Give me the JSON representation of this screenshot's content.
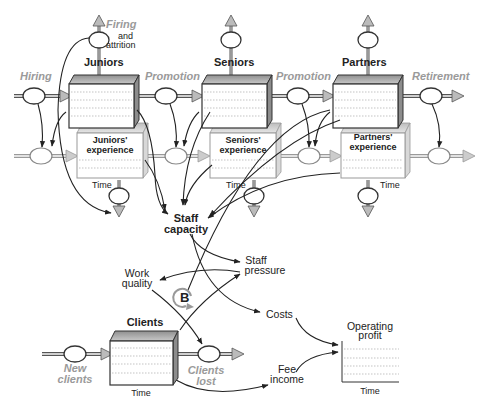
{
  "diagram": {
    "type": "stock-and-flow",
    "stocks": {
      "juniors": "Juniors",
      "seniors": "Seniors",
      "partners": "Partners",
      "juniors_exp_1": "Juniors'",
      "juniors_exp_2": "experience",
      "seniors_exp_1": "Seniors'",
      "seniors_exp_2": "experience",
      "partners_exp_1": "Partners'",
      "partners_exp_2": "experience",
      "clients": "Clients"
    },
    "flows": {
      "hiring": "Hiring",
      "promotion_1": "Promotion",
      "promotion_2": "Promotion",
      "retirement": "Retirement",
      "firing_1": "Firing",
      "firing_2": "and",
      "firing_3": "attrition",
      "new_clients_1": "New",
      "new_clients_2": "clients",
      "clients_lost_1": "Clients",
      "clients_lost_2": "lost"
    },
    "variables": {
      "staff_capacity_1": "Staff",
      "staff_capacity_2": "capacity",
      "staff_pressure_1": "Staff",
      "staff_pressure_2": "pressure",
      "work_quality_1": "Work",
      "work_quality_2": "quality",
      "costs": "Costs",
      "fee_income_1": "Fee",
      "fee_income_2": "income",
      "operating_profit_1": "Operating",
      "operating_profit_2": "profit"
    },
    "axis_label": "Time",
    "loop_marker": "B",
    "colors": {
      "stock_top": "#a8a8a8",
      "stock_side": "#8a8a8a",
      "flow_label": "#9a9a9a",
      "line": "#222222"
    }
  }
}
